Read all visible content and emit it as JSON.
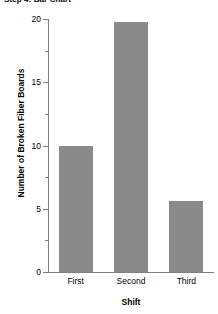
{
  "chart_data": {
    "type": "bar",
    "title": "Step 4: Bar Chart",
    "categories": [
      "First",
      "Second",
      "Third"
    ],
    "values": [
      10,
      19.8,
      5.6
    ],
    "xlabel": "Shift",
    "ylabel": "Number of Broken Fiber Boards",
    "ylim": [
      0,
      20
    ],
    "ytick_major": [
      "0",
      "5",
      "10",
      "15",
      "20"
    ],
    "ytick_major_values": [
      0,
      5,
      10,
      15,
      20
    ],
    "ytick_minor_values": [
      2.5,
      7.5,
      12.5,
      17.5
    ],
    "grid": false,
    "legend": false,
    "bar_color": "#8a8a8a",
    "axis_color": "#808080",
    "text_color": "#000000",
    "background": "#ffffff"
  }
}
